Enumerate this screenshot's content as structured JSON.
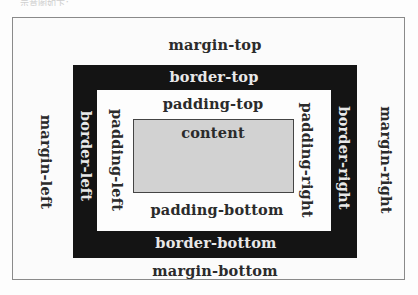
{
  "page": {
    "header_fragment": "……示意图如下："
  },
  "diagram": {
    "colors": {
      "border_fill": "#141414",
      "content_fill": "#d2d2d2",
      "background": "#fdfdfd",
      "frame_line": "#8a8a8a"
    },
    "labels": {
      "margin_top": "margin-top",
      "margin_bottom": "margin-bottom",
      "margin_left": "margin-left",
      "margin_right": "margin-right",
      "border_top": "border-top",
      "border_bottom": "border-bottom",
      "border_left": "border-left",
      "border_right": "border-right",
      "padding_top": "padding-top",
      "padding_bottom": "padding-bottom",
      "padding_left": "padding-left",
      "padding_right": "padding-right",
      "content": "content"
    }
  }
}
